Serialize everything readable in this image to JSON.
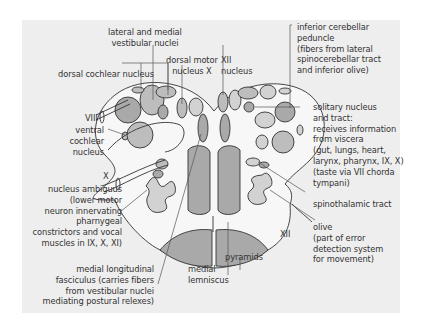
{
  "colors": {
    "background": "#eeeeee",
    "outline": "#333333",
    "fill_dark": "#a9a9a9",
    "fill_medium": "#bdbdbd",
    "fill_light": "#d2d2d2",
    "fill_white": "#f7f7f7"
  },
  "labels": {
    "lateral_medial_vestibular": [
      "lateral and medial",
      "vestibular nuclei"
    ],
    "dorsal_cochlear": "dorsal cochlear nucleus",
    "dorsal_motor_x": [
      "dorsal motor",
      "nucleus X"
    ],
    "xii_nucleus": [
      "XII",
      "nucleus"
    ],
    "inferior_cerebellar": [
      "inferior cerebellar",
      "peduncle",
      "(fibers from lateral",
      "spinocerebellar tract",
      "and inferior olive)"
    ],
    "viii": "VIII",
    "ventral_cochlear": [
      "ventral",
      "cochlear",
      "nucleus"
    ],
    "x_nerve": "X",
    "solitary": [
      "solitary nucleus",
      "and tract:",
      "receives information",
      "from viscera",
      "(gut, lungs, heart,",
      "larynx, pharynx, IX, X)",
      "(taste via VII chorda",
      "tympani)"
    ],
    "spinothalamic": "spinothalamic tract",
    "nucleus_ambiguus": [
      "nucleus ambiguus",
      "(lower motor",
      "neuron innervating",
      "pharnygeal",
      "constrictors and vocal",
      "muscles in IX, X, XI)"
    ],
    "olive": [
      "olive",
      "(part of error",
      "detection system",
      "for movement)"
    ],
    "xii_nerve": "XII",
    "medial_longitudinal": [
      "medial longitudinal",
      "fasciculus (carries fibers",
      "from vestibular nuclei",
      "mediating postural relexes)"
    ],
    "medial_lemniscus": [
      "medial",
      "lemniscus"
    ],
    "pyramids": "pyramids"
  }
}
